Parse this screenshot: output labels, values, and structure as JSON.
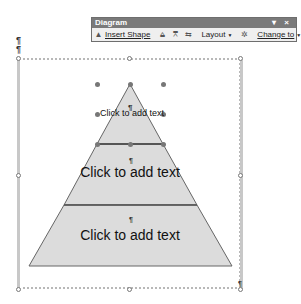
{
  "toolbar": {
    "title": "Diagram",
    "controls": "▾ ×",
    "insert_shape": "Insert Shape",
    "layout": "Layout",
    "change_to": "Change to",
    "icons": [
      "move-shape-backward-icon",
      "move-shape-forward-icon",
      "reverse-diagram-icon",
      "autoformat-icon",
      "text-wrapping-icon"
    ]
  },
  "document": {
    "paragraph_mark": "¶"
  },
  "diagram": {
    "type": "pyramid",
    "fill_color": "#dcdcdc",
    "stroke_color": "#555555",
    "levels": [
      {
        "label": "Click to add text",
        "mark": "¶"
      },
      {
        "label": "Click to add text",
        "mark": "¶"
      },
      {
        "label": "Click to add text",
        "mark": "¶"
      }
    ]
  }
}
